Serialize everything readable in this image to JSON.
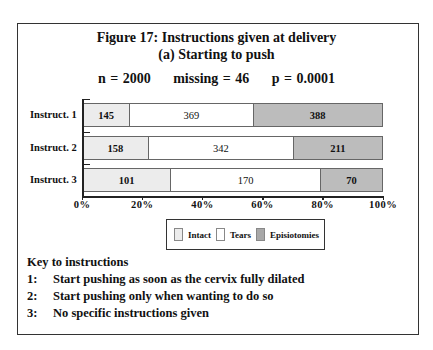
{
  "chart_data": {
    "type": "bar",
    "orientation": "horizontal",
    "stacked": "percent",
    "title": "Figure 17: Instructions given at delivery",
    "subtitle": "(a) Starting to push",
    "stats": {
      "n": "n = 2000",
      "missing": "missing = 46",
      "p": "p = 0.0001"
    },
    "categories": [
      "Instruct. 1",
      "Instruct. 2",
      "Instruct. 3"
    ],
    "series": [
      {
        "name": "Intact",
        "values": [
          145,
          158,
          101
        ],
        "color": "#ececec"
      },
      {
        "name": "Tears",
        "values": [
          369,
          342,
          170
        ],
        "color": "#ffffff"
      },
      {
        "name": "Episiotomies",
        "values": [
          388,
          211,
          70
        ],
        "color": "#bcbcbc"
      }
    ],
    "xticks": [
      "0%",
      "20%",
      "40%",
      "60%",
      "80%",
      "100%"
    ],
    "xlim": [
      0,
      100
    ],
    "xlabel": "",
    "ylabel": "",
    "grid": false,
    "legend_position": "bottom-center"
  },
  "key": {
    "heading": "Key to instructions",
    "items": [
      {
        "num": "1:",
        "text": "Start pushing as soon as the cervix fully dilated"
      },
      {
        "num": "2:",
        "text": "Start pushing only when wanting to do so"
      },
      {
        "num": "3:",
        "text": "No specific instructions given"
      }
    ]
  }
}
